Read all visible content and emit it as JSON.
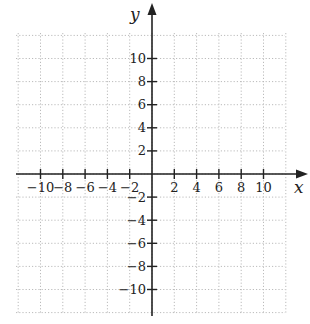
{
  "diagram": {
    "type": "coordinate-plane",
    "x_axis": {
      "label": "x",
      "ticks": [
        -10,
        -8,
        -6,
        -4,
        -2,
        2,
        4,
        6,
        8,
        10
      ]
    },
    "y_axis": {
      "label": "y",
      "ticks": [
        10,
        8,
        6,
        4,
        2,
        -2,
        -4,
        -6,
        -8,
        -10
      ]
    },
    "grid": {
      "step": 2,
      "x_range": [
        -12,
        12
      ],
      "y_range": [
        -12,
        12
      ],
      "style": "dotted"
    },
    "colors": {
      "axis": "#222222",
      "grid": "#bbbbbb",
      "text": "#222222"
    }
  },
  "labels": {
    "x_axis_label": "x",
    "y_axis_label": "y",
    "x_ticks": [
      "−10",
      "−8",
      "−6",
      "−4",
      "−2",
      "2",
      "4",
      "6",
      "8",
      "10"
    ],
    "y_ticks": [
      "10",
      "8",
      "6",
      "4",
      "2",
      "−2",
      "−4",
      "−6",
      "−8",
      "−10"
    ]
  }
}
